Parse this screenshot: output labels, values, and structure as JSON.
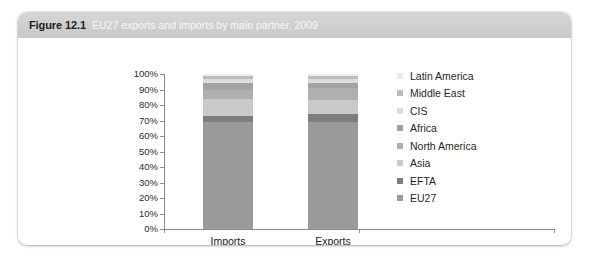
{
  "figure": {
    "number": "Figure 12.1",
    "caption": "EU27 exports and imports by main partner, 2009"
  },
  "chart_data": {
    "type": "bar",
    "stacked": true,
    "title": "EU27 exports and imports by main partner, 2009",
    "xlabel": "",
    "ylabel": "",
    "ylim": [
      0,
      100
    ],
    "ytick_labels": [
      "100%",
      "90%",
      "80%",
      "70%",
      "60%",
      "50%",
      "40%",
      "30%",
      "20%",
      "10%",
      "0%"
    ],
    "grid": false,
    "legend_position": "right",
    "categories": [
      "Imports",
      "Exports"
    ],
    "series": [
      {
        "name": "EU27",
        "color": "#9a9a9a",
        "values": [
          69,
          69
        ]
      },
      {
        "name": "EFTA",
        "color": "#7d7d7d",
        "values": [
          4,
          5
        ]
      },
      {
        "name": "Asia",
        "color": "#c9c9c9",
        "values": [
          11,
          9
        ]
      },
      {
        "name": "North America",
        "color": "#b0b0b0",
        "values": [
          6,
          8
        ]
      },
      {
        "name": "Africa",
        "color": "#a3a3a3",
        "values": [
          4,
          3
        ]
      },
      {
        "name": "CIS",
        "color": "#dcdcdc",
        "values": [
          3,
          3
        ]
      },
      {
        "name": "Middle East",
        "color": "#bdbdbd",
        "values": [
          2,
          2
        ]
      },
      {
        "name": "Latin America",
        "color": "#ececec",
        "values": [
          1,
          1
        ]
      }
    ],
    "legend_order": [
      "Latin America",
      "Middle East",
      "CIS",
      "Africa",
      "North America",
      "Asia",
      "EFTA",
      "EU27"
    ]
  }
}
